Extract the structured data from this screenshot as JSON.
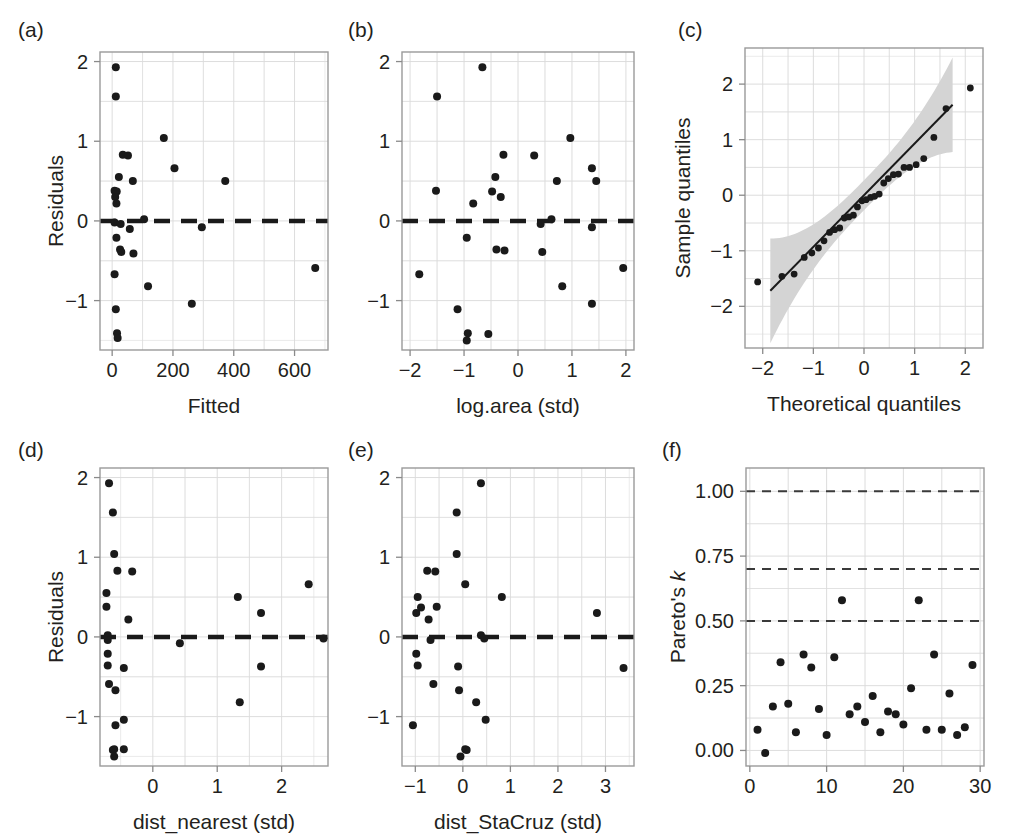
{
  "figure": {
    "background": "#ffffff",
    "point_color": "#1a1a1a",
    "grid_color": "#dcdcdc",
    "frame_color": "#9a9a9a",
    "band_color": "#d4d4d4",
    "dashed_color": "#1a1a1a"
  },
  "panels": [
    {
      "tag": "(a)",
      "xlabel": "Fitted",
      "ylabel": "Residuals"
    },
    {
      "tag": "(b)",
      "xlabel": "log.area (std)",
      "ylabel": ""
    },
    {
      "tag": "(c)",
      "xlabel": "Theoretical quantiles",
      "ylabel": "Sample quantiles"
    },
    {
      "tag": "(d)",
      "xlabel": "dist_nearest (std)",
      "ylabel": "Residuals"
    },
    {
      "tag": "(e)",
      "xlabel": "dist_StaCruz (std)",
      "ylabel": ""
    },
    {
      "tag": "(f)",
      "xlabel": "",
      "ylabel_prefix": "Pareto's ",
      "ylabel_italic": "k"
    }
  ],
  "chart_data": [
    {
      "id": "a",
      "type": "scatter",
      "title": "(a)",
      "xlabel": "Fitted",
      "ylabel": "Residuals",
      "xlim": [
        -40,
        710
      ],
      "ylim": [
        -1.62,
        2.12
      ],
      "xticks": [
        0,
        200,
        400,
        600
      ],
      "yticks": [
        -1,
        0,
        1,
        2
      ],
      "grid": true,
      "hline": 0,
      "hline_style": "dashed",
      "x": [
        12,
        12,
        170,
        35,
        52,
        205,
        22,
        68,
        372,
        8,
        15,
        10,
        14,
        8,
        28,
        58,
        105,
        295,
        14,
        26,
        30,
        70,
        8,
        118,
        262,
        668,
        12,
        16,
        18
      ],
      "y": [
        1.93,
        1.56,
        1.04,
        0.83,
        0.82,
        0.66,
        0.55,
        0.5,
        0.5,
        0.38,
        0.37,
        0.3,
        0.22,
        -0.02,
        -0.04,
        -0.1,
        0.02,
        -0.08,
        -0.21,
        -0.36,
        -0.39,
        -0.41,
        -0.67,
        -0.82,
        -1.04,
        -0.59,
        -1.11,
        -1.41,
        -1.47
      ]
    },
    {
      "id": "b",
      "type": "scatter",
      "title": "(b)",
      "xlabel": "log.area (std)",
      "ylabel": "Residuals",
      "xlim": [
        -2.15,
        2.15
      ],
      "ylim": [
        -1.62,
        2.12
      ],
      "xticks": [
        -2,
        -1,
        0,
        1,
        2
      ],
      "yticks": [
        -1,
        0,
        1,
        2
      ],
      "grid": true,
      "hline": 0,
      "hline_style": "dashed",
      "x": [
        -0.66,
        -1.5,
        0.97,
        -0.27,
        0.3,
        1.37,
        -0.42,
        0.72,
        1.45,
        -1.52,
        -0.48,
        -0.32,
        -0.83,
        0.42,
        0.62,
        1.37,
        -0.95,
        -0.4,
        -0.25,
        0.45,
        -1.83,
        1.95,
        0.82,
        1.37,
        -1.12,
        -0.93,
        -0.55,
        -0.95
      ],
      "y": [
        1.93,
        1.56,
        1.04,
        0.83,
        0.82,
        0.66,
        0.55,
        0.5,
        0.5,
        0.38,
        0.37,
        0.3,
        0.22,
        -0.04,
        0.02,
        -0.08,
        -0.21,
        -0.36,
        -0.37,
        -0.39,
        -0.67,
        -0.59,
        -0.82,
        -1.04,
        -1.11,
        -1.41,
        -1.42,
        -1.5
      ]
    },
    {
      "id": "c",
      "type": "scatter",
      "title": "(c)",
      "xlabel": "Theoretical quantiles",
      "ylabel": "Sample quantiles",
      "xlim": [
        -2.35,
        2.35
      ],
      "ylim": [
        -2.75,
        2.65
      ],
      "xticks": [
        -2,
        -1,
        0,
        1,
        2
      ],
      "yticks": [
        -2,
        -1,
        0,
        1,
        2
      ],
      "grid": true,
      "reference_line": {
        "slope": 0.93,
        "intercept": 0.0,
        "x_from": -1.85,
        "x_to": 1.75
      },
      "confidence_band": true,
      "x": [
        -2.1,
        -1.62,
        -1.38,
        -1.18,
        -1.03,
        -0.9,
        -0.79,
        -0.68,
        -0.58,
        -0.48,
        -0.39,
        -0.3,
        -0.21,
        -0.13,
        -0.04,
        0.04,
        0.13,
        0.21,
        0.3,
        0.39,
        0.48,
        0.58,
        0.68,
        0.79,
        0.9,
        1.03,
        1.18,
        1.38,
        1.62,
        2.1
      ],
      "y": [
        -1.56,
        -1.46,
        -1.42,
        -1.12,
        -1.04,
        -0.95,
        -0.82,
        -0.67,
        -0.62,
        -0.59,
        -0.41,
        -0.39,
        -0.36,
        -0.21,
        -0.1,
        -0.08,
        -0.04,
        -0.02,
        0.02,
        0.22,
        0.3,
        0.37,
        0.38,
        0.5,
        0.5,
        0.55,
        0.66,
        1.04,
        1.56,
        1.93
      ]
    },
    {
      "id": "d",
      "type": "scatter",
      "title": "(d)",
      "xlabel": "dist_nearest (std)",
      "ylabel": "Residuals",
      "xlim": [
        -0.82,
        2.72
      ],
      "ylim": [
        -1.62,
        2.12
      ],
      "xticks": [
        0,
        1,
        2
      ],
      "yticks": [
        -1,
        0,
        1,
        2
      ],
      "grid": true,
      "hline": 0,
      "hline_style": "dashed",
      "x": [
        -0.68,
        -0.62,
        -0.6,
        -0.55,
        -0.32,
        2.42,
        1.32,
        1.68,
        -0.72,
        -0.72,
        -0.38,
        -0.7,
        -0.7,
        0.42,
        2.65,
        -0.7,
        -0.7,
        -0.45,
        1.68,
        -0.68,
        -0.58,
        1.35,
        -0.45,
        -0.58,
        -0.6,
        -0.45,
        -0.62,
        -0.6
      ],
      "y": [
        1.93,
        1.56,
        1.04,
        0.83,
        0.82,
        0.66,
        0.5,
        0.3,
        0.55,
        0.38,
        0.22,
        0.02,
        -0.04,
        -0.08,
        -0.02,
        -0.21,
        -0.36,
        -0.39,
        -0.37,
        -0.59,
        -0.67,
        -0.82,
        -1.04,
        -1.11,
        -1.41,
        -1.41,
        -1.42,
        -1.5
      ]
    },
    {
      "id": "e",
      "type": "scatter",
      "title": "(e)",
      "xlabel": "dist_StaCruz (std)",
      "ylabel": "Residuals",
      "xlim": [
        -1.28,
        3.6
      ],
      "ylim": [
        -1.62,
        2.12
      ],
      "xticks": [
        -1,
        0,
        1,
        2,
        3
      ],
      "yticks": [
        -1,
        0,
        1,
        2
      ],
      "grid": true,
      "hline": 0,
      "hline_style": "dashed",
      "x": [
        0.38,
        -0.13,
        -0.13,
        -0.75,
        -0.58,
        0.05,
        0.82,
        -0.95,
        -0.55,
        -0.88,
        -0.98,
        2.82,
        -0.72,
        -0.68,
        0.38,
        0.45,
        -0.98,
        -0.95,
        -0.1,
        3.38,
        -0.62,
        -0.08,
        0.28,
        0.48,
        -1.05,
        0.05,
        0.08,
        -0.05
      ],
      "y": [
        1.93,
        1.56,
        1.04,
        0.83,
        0.82,
        0.66,
        0.5,
        0.5,
        0.38,
        0.37,
        0.3,
        0.3,
        0.22,
        -0.04,
        0.02,
        -0.02,
        -0.21,
        -0.36,
        -0.37,
        -0.39,
        -0.59,
        -0.67,
        -0.82,
        -1.04,
        -1.11,
        -1.41,
        -1.42,
        -1.5
      ]
    },
    {
      "id": "f",
      "type": "scatter",
      "title": "(f)",
      "xlabel": "",
      "ylabel": "Pareto's k",
      "xlim": [
        -0.5,
        30.5
      ],
      "ylim": [
        -0.06,
        1.09
      ],
      "xticks": [
        0,
        10,
        20,
        30
      ],
      "yticks": [
        0.0,
        0.25,
        0.5,
        0.75,
        1.0
      ],
      "ytick_labels": [
        "0.00",
        "0.25",
        "0.50",
        "0.75",
        "1.00"
      ],
      "grid": true,
      "reference_lines": [
        0.5,
        0.7,
        1.0
      ],
      "reference_line_style": "dashed",
      "x": [
        1,
        2,
        3,
        4,
        5,
        6,
        7,
        8,
        9,
        10,
        11,
        12,
        13,
        14,
        15,
        16,
        17,
        18,
        19,
        20,
        21,
        22,
        23,
        24,
        25,
        26,
        27,
        28,
        29
      ],
      "y": [
        0.08,
        -0.01,
        0.17,
        0.34,
        0.18,
        0.07,
        0.37,
        0.32,
        0.16,
        0.06,
        0.36,
        0.58,
        0.14,
        0.17,
        0.11,
        0.21,
        0.07,
        0.15,
        0.14,
        0.1,
        0.24,
        0.58,
        0.08,
        0.37,
        0.08,
        0.22,
        0.06,
        0.09,
        0.33
      ]
    }
  ]
}
